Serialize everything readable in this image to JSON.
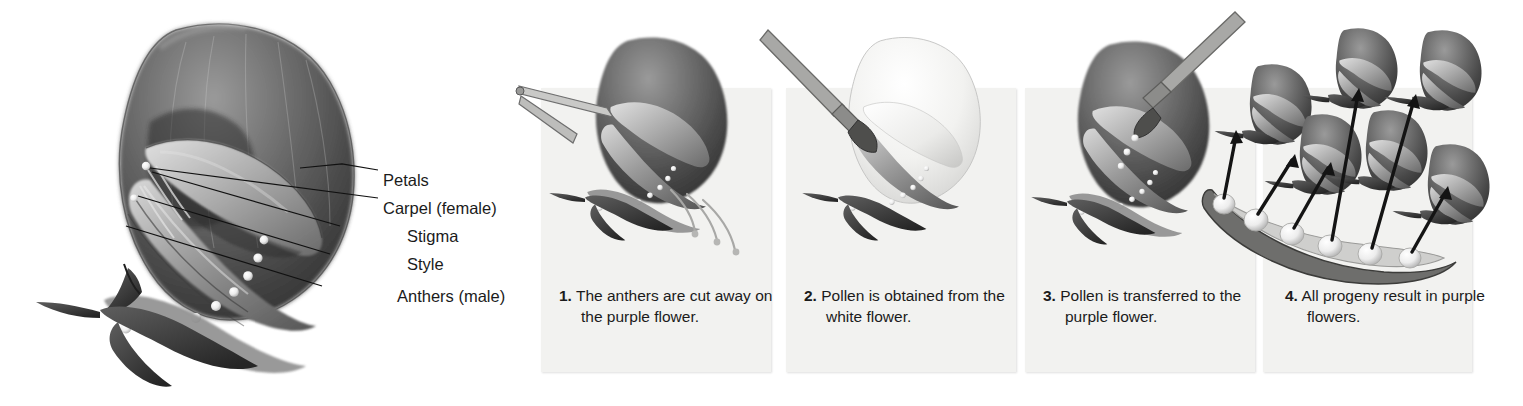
{
  "figure": {
    "type": "biology-illustration",
    "palette": {
      "background": "#ffffff",
      "panel_background": "#f2f2f0",
      "text": "#1b1b1b",
      "petal_dark": "#4a4a4a",
      "petal_mid": "#8a8a8a",
      "petal_light": "#c8c8c8",
      "white_flower": "#f0f0ee",
      "anther_dot": "#ffffff",
      "arrow": "#141414"
    }
  },
  "anatomy": {
    "labels": [
      {
        "text": "Petals",
        "y": 172,
        "leader_length": 0
      },
      {
        "text": "Carpel (female)",
        "y": 200,
        "leader_length": 0
      },
      {
        "text": "Stigma",
        "y": 228,
        "leader_length": 38
      },
      {
        "text": "Style",
        "y": 256,
        "leader_length": 38
      },
      {
        "text": "Anthers (male)",
        "y": 288,
        "leader_length": 50
      }
    ]
  },
  "steps": [
    {
      "number": "1.",
      "text": "The anthers are cut away on the purple flower.",
      "art": "purple-flower-with-tweezers-removing-anthers"
    },
    {
      "number": "2.",
      "text": "Pollen is obtained from the white flower.",
      "art": "white-flower-with-brush-collecting-pollen"
    },
    {
      "number": "3.",
      "text": "Pollen is transferred to the purple flower.",
      "art": "brush-transferring-pollen-to-purple-flower"
    },
    {
      "number": "4.",
      "text": "All progeny result in purple flowers.",
      "art": "pea-pod-with-arrows-to-seven-purple-progeny-flowers"
    }
  ]
}
